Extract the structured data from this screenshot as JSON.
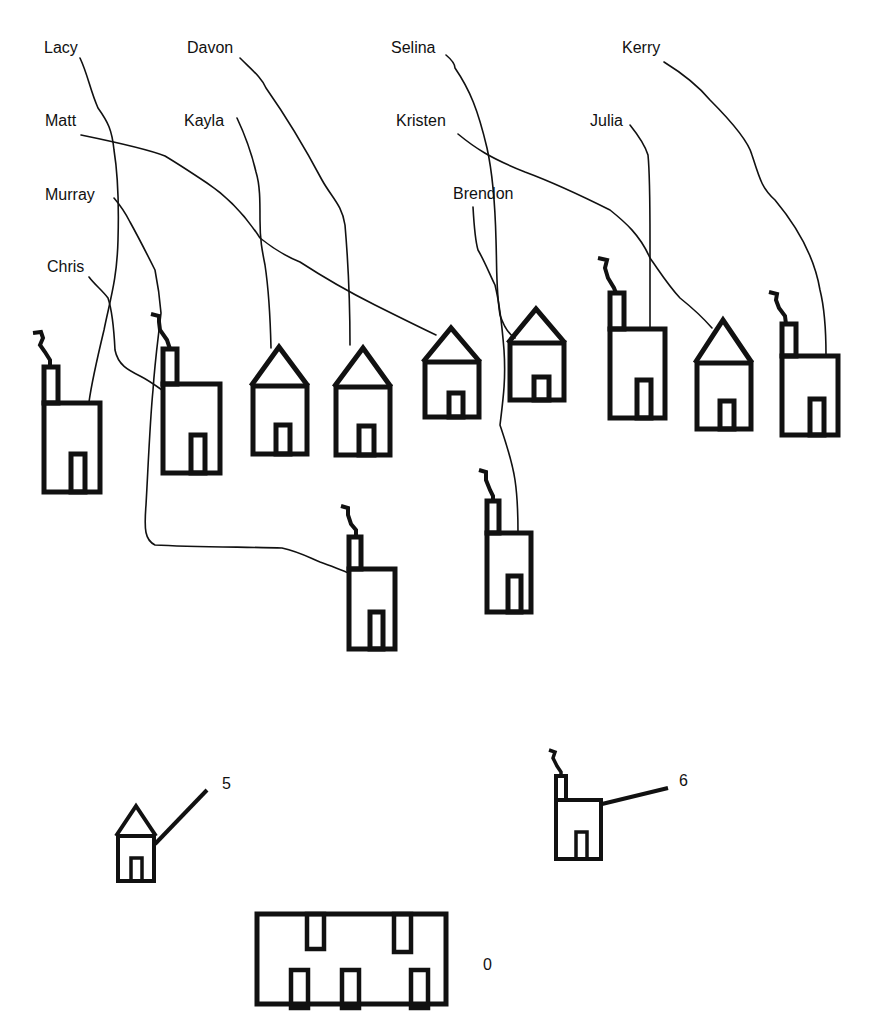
{
  "diagram": {
    "type": "matching-diagram",
    "people": [
      {
        "name": "Lacy",
        "x": 44,
        "y": 40
      },
      {
        "name": "Davon",
        "x": 187,
        "y": 40
      },
      {
        "name": "Selina",
        "x": 391,
        "y": 40
      },
      {
        "name": "Kerry",
        "x": 622,
        "y": 40
      },
      {
        "name": "Matt",
        "x": 45,
        "y": 113
      },
      {
        "name": "Kayla",
        "x": 184,
        "y": 113
      },
      {
        "name": "Kristen",
        "x": 396,
        "y": 113
      },
      {
        "name": "Julia",
        "x": 590,
        "y": 113
      },
      {
        "name": "Murray",
        "x": 45,
        "y": 187
      },
      {
        "name": "Brendon",
        "x": 453,
        "y": 186
      },
      {
        "name": "Chris",
        "x": 47,
        "y": 259
      }
    ],
    "buildings": [
      {
        "id": "b1",
        "kind": "factory",
        "x": 44,
        "y": 403,
        "w": 56,
        "h": 89,
        "label_for": "Lacy"
      },
      {
        "id": "b2",
        "kind": "factory",
        "x": 163,
        "y": 384,
        "w": 57,
        "h": 89,
        "label_for": "Chris"
      },
      {
        "id": "b3",
        "kind": "house",
        "x": 253,
        "y": 386,
        "w": 54,
        "h": 68,
        "label_for": "Kayla"
      },
      {
        "id": "b4",
        "kind": "house",
        "x": 336,
        "y": 387,
        "w": 54,
        "h": 68,
        "label_for": "Davon"
      },
      {
        "id": "b5",
        "kind": "house",
        "x": 425,
        "y": 362,
        "w": 54,
        "h": 55,
        "label_for": "Matt"
      },
      {
        "id": "b6",
        "kind": "house",
        "x": 510,
        "y": 343,
        "w": 54,
        "h": 57,
        "label_for": "Selina"
      },
      {
        "id": "b7",
        "kind": "factory",
        "x": 610,
        "y": 329,
        "w": 55,
        "h": 89,
        "label_for": "Julia"
      },
      {
        "id": "b8",
        "kind": "house",
        "x": 697,
        "y": 363,
        "w": 54,
        "h": 66,
        "label_for": "Kristen"
      },
      {
        "id": "b9",
        "kind": "factory",
        "x": 782,
        "y": 356,
        "w": 56,
        "h": 79,
        "label_for": "Kerry"
      },
      {
        "id": "b10",
        "kind": "factory",
        "x": 349,
        "y": 569,
        "w": 46,
        "h": 80,
        "label_for": "Murray"
      },
      {
        "id": "b11",
        "kind": "factory",
        "x": 487,
        "y": 533,
        "w": 44,
        "h": 79,
        "label_for": "Brendon"
      }
    ],
    "legend": [
      {
        "kind": "house",
        "value": "5",
        "label_x": 222,
        "label_y": 776
      },
      {
        "kind": "factory",
        "value": "6",
        "label_x": 679,
        "label_y": 773
      },
      {
        "kind": "apartment",
        "value": "0",
        "label_x": 483,
        "label_y": 957
      }
    ]
  },
  "texts": {
    "lacy": "Lacy",
    "davon": "Davon",
    "selina": "Selina",
    "kerry": "Kerry",
    "matt": "Matt",
    "kayla": "Kayla",
    "kristen": "Kristen",
    "julia": "Julia",
    "murray": "Murray",
    "brendon": "Brendon",
    "chris": "Chris",
    "legend_house": "5",
    "legend_factory": "6",
    "legend_apartment": "0"
  }
}
